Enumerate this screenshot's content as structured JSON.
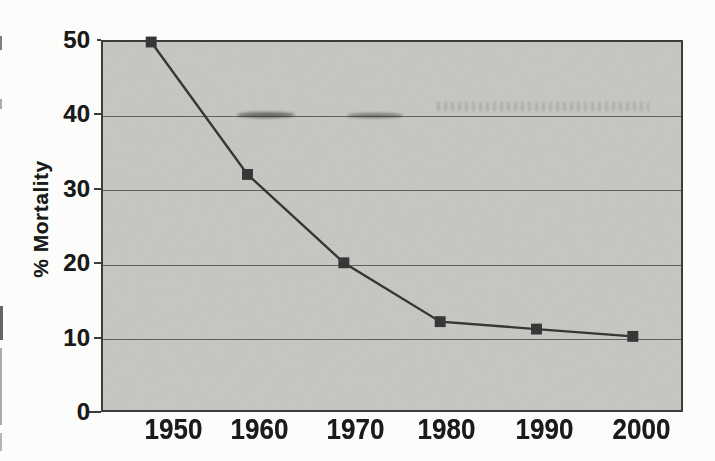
{
  "chart_data": {
    "type": "line",
    "categories": [
      "1950",
      "1960",
      "1970",
      "1980",
      "1990",
      "2000"
    ],
    "series": [
      {
        "name": "% Mortality",
        "values": [
          50,
          32,
          20,
          12,
          11,
          10
        ]
      }
    ],
    "title": "",
    "xlabel": "",
    "ylabel": "% Mortality",
    "ylim": [
      0,
      50
    ],
    "yticks": [
      0,
      10,
      20,
      30,
      40,
      50
    ],
    "grid": "horizontal-only",
    "legend_position": "none",
    "marker_shape": "filled-square",
    "plot_background_note": "light gray filled plot area, scanned paper texture"
  },
  "colors": {
    "page_bg": "#fcfcfb",
    "plot_bg": "#c7c6c2",
    "frame": "#3c3c3c",
    "gridline": "#4d4d4d",
    "series_line": "#363636",
    "marker": "#373737",
    "text": "#1b1b1b"
  }
}
